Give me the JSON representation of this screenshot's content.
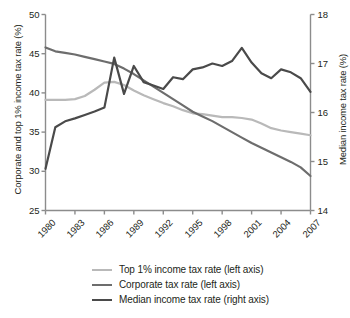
{
  "chart_data": {
    "type": "line",
    "title": "",
    "xlabel": "",
    "x": [
      1980,
      1981,
      1982,
      1983,
      1984,
      1985,
      1986,
      1987,
      1988,
      1989,
      1990,
      1991,
      1992,
      1993,
      1994,
      1995,
      1996,
      1997,
      1998,
      1999,
      2000,
      2001,
      2002,
      2003,
      2004,
      2005,
      2006,
      2007
    ],
    "xlim": [
      1980,
      2007
    ],
    "xticks": [
      "1980",
      "1983",
      "1986",
      "1989",
      "1992",
      "1995",
      "1998",
      "2001",
      "2004",
      "2007"
    ],
    "xtick_values": [
      1980,
      1983,
      1986,
      1989,
      1992,
      1995,
      1998,
      2001,
      2004,
      2007
    ],
    "grid": false,
    "legend_position": "bottom",
    "axes": [
      {
        "id": "left",
        "ylabel": "Corporate and top 1% income tax rate (%)",
        "ylim": [
          25,
          50
        ],
        "yticks": [
          "25",
          "30",
          "35",
          "40",
          "45",
          "50"
        ],
        "ytick_values": [
          25,
          30,
          35,
          40,
          45,
          50
        ]
      },
      {
        "id": "right",
        "ylabel": "Median income tax rate (%)",
        "ylim": [
          14,
          18
        ],
        "yticks": [
          "14",
          "15",
          "16",
          "17",
          "18"
        ],
        "ytick_values": [
          14,
          15,
          16,
          17,
          18
        ]
      }
    ],
    "series": [
      {
        "name": "Top 1% income tax rate (left axis)",
        "axis": "left",
        "color": "#b9b9b9",
        "width": 2.2,
        "values": [
          39.1,
          39.1,
          39.1,
          39.2,
          39.6,
          40.4,
          41.3,
          41.4,
          41.0,
          40.3,
          39.7,
          39.2,
          38.7,
          38.3,
          37.8,
          37.4,
          37.3,
          37.1,
          36.9,
          36.9,
          36.8,
          36.6,
          36.1,
          35.5,
          35.2,
          35.0,
          34.8,
          34.6
        ]
      },
      {
        "name": "Corporate tax rate (left axis)",
        "axis": "left",
        "color": "#6d6d6d",
        "width": 2.2,
        "values": [
          45.8,
          45.3,
          45.1,
          44.9,
          44.6,
          44.3,
          44.0,
          43.7,
          43.1,
          42.4,
          41.6,
          40.8,
          40.0,
          39.2,
          38.4,
          37.6,
          37.0,
          36.4,
          35.7,
          35.0,
          34.3,
          33.6,
          33.0,
          32.4,
          31.8,
          31.2,
          30.5,
          29.4
        ]
      },
      {
        "name": "Median income tax rate (right axis)",
        "axis": "right",
        "color": "#4a4a4a",
        "width": 2.2,
        "values": [
          14.85,
          15.7,
          15.82,
          15.88,
          15.95,
          16.02,
          16.1,
          17.12,
          16.38,
          16.95,
          16.62,
          16.55,
          16.48,
          16.72,
          16.68,
          16.88,
          16.92,
          17.0,
          16.95,
          17.05,
          17.32,
          17.02,
          16.8,
          16.7,
          16.88,
          16.82,
          16.7,
          16.42
        ]
      }
    ]
  },
  "legend": {
    "items": [
      {
        "label": "Top 1% income tax rate (left axis)",
        "color": "#b9b9b9"
      },
      {
        "label": "Corporate tax rate (left axis)",
        "color": "#6d6d6d"
      },
      {
        "label": "Median income tax rate (right axis)",
        "color": "#4a4a4a"
      }
    ]
  }
}
